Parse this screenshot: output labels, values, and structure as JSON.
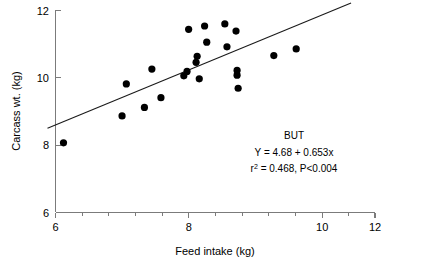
{
  "chart_data": {
    "type": "scatter",
    "title": "",
    "xlabel": "Feed intake (kg)",
    "ylabel": "Carcass wt. (kg)",
    "xlim": [
      6,
      12
    ],
    "ylim": [
      6,
      12
    ],
    "grid": false,
    "legend": null,
    "xticks": [
      "6",
      "8",
      "10",
      "12"
    ],
    "xtick_values": [
      6,
      8,
      10,
      12
    ],
    "xminor_step": 0.5,
    "yticks": [
      "6",
      "8",
      "10",
      "12"
    ],
    "ytick_values": [
      6,
      8,
      10,
      12
    ],
    "series": [
      {
        "name": "BUT",
        "marker": "filled-circle",
        "color": "#000000",
        "points": [
          {
            "x": 6.15,
            "y": 8.07
          },
          {
            "x": 7.25,
            "y": 8.87
          },
          {
            "x": 7.33,
            "y": 9.82
          },
          {
            "x": 7.67,
            "y": 9.12
          },
          {
            "x": 7.81,
            "y": 10.26
          },
          {
            "x": 7.98,
            "y": 9.41
          },
          {
            "x": 8.41,
            "y": 10.06
          },
          {
            "x": 8.47,
            "y": 10.19
          },
          {
            "x": 8.5,
            "y": 11.44
          },
          {
            "x": 8.64,
            "y": 10.46
          },
          {
            "x": 8.66,
            "y": 10.64
          },
          {
            "x": 8.7,
            "y": 9.97
          },
          {
            "x": 8.8,
            "y": 11.54
          },
          {
            "x": 8.84,
            "y": 11.06
          },
          {
            "x": 9.18,
            "y": 11.6
          },
          {
            "x": 9.22,
            "y": 10.92
          },
          {
            "x": 9.39,
            "y": 11.39
          },
          {
            "x": 9.41,
            "y": 10.22
          },
          {
            "x": 9.41,
            "y": 10.08
          },
          {
            "x": 9.43,
            "y": 9.69
          },
          {
            "x": 10.1,
            "y": 10.66
          },
          {
            "x": 10.52,
            "y": 10.86
          }
        ]
      }
    ],
    "fit_line": {
      "slope": 0.653,
      "intercept": 4.68,
      "x_start": 5.85,
      "x_end": 11.55,
      "color": "#1a1a1a"
    },
    "annotations": {
      "group_label": "BUT",
      "equation": "Y = 4.68 + 0.653x",
      "stats_prefix": "r",
      "stats_sup": "2",
      "stats_suffix": " = 0.468, P<0.004"
    }
  }
}
